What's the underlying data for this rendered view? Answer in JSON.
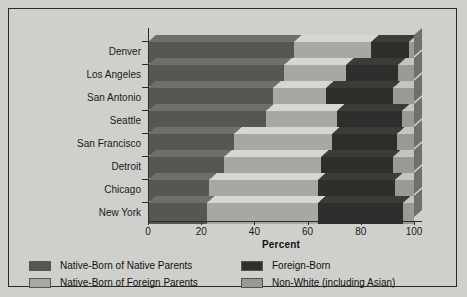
{
  "chart_data": {
    "type": "bar",
    "orientation": "horizontal",
    "stacked": true,
    "title": "",
    "xlabel": "Percent",
    "ylabel": "",
    "xlim": [
      0,
      100
    ],
    "xticks": [
      0,
      20,
      40,
      60,
      80,
      100
    ],
    "xticklabels": [
      "0",
      "20",
      "40",
      "60",
      "80",
      "100"
    ],
    "grid": false,
    "legend_position": "bottom",
    "categories": [
      "Denver",
      "Los Angeles",
      "San Antonio",
      "Seattle",
      "San Francisco",
      "Detroit",
      "Chicago",
      "New York"
    ],
    "series": [
      {
        "name": "Native-Born of Native Parents",
        "color": "#575751",
        "values": [
          55,
          51,
          47,
          44.5,
          32.5,
          28.5,
          23,
          22
        ]
      },
      {
        "name": "Native-Born of Foreign Parents",
        "color": "#a8a8a2",
        "values": [
          29,
          23.5,
          20,
          26.5,
          36.5,
          36.5,
          41,
          42
        ]
      },
      {
        "name": "Foreign-Born",
        "color": "#2e2e2c",
        "values": [
          14,
          19.5,
          25,
          24.5,
          24.5,
          27,
          29,
          32
        ]
      },
      {
        "name": "Non-White (including Asian)",
        "color": "#9a9a94",
        "values": [
          2,
          6,
          8,
          4.5,
          6.5,
          8,
          7,
          4
        ]
      }
    ]
  },
  "legend": {
    "items": [
      {
        "label": "Native-Born of Native Parents",
        "color": "#575751"
      },
      {
        "label": "Native-Born of Foreign Parents",
        "color": "#a8a8a2"
      },
      {
        "label": "Foreign-Born",
        "color": "#2e2e2c"
      },
      {
        "label": "Non-White (including Asian)",
        "color": "#9a9a94"
      }
    ]
  },
  "colors": {
    "background": "#cfcfcb",
    "frame": "#2b2b2b",
    "axis": "#2b2b2b",
    "text": "#111111"
  }
}
